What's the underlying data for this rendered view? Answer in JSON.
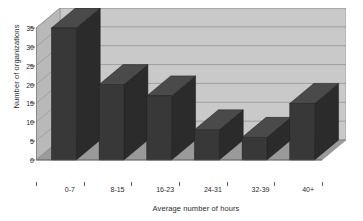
{
  "chart_data": {
    "type": "bar",
    "title": "",
    "xlabel": "Average number of hours",
    "ylabel": "Number of organizations",
    "categories": [
      "0-7",
      "8-15",
      "16-23",
      "24-31",
      "32-39",
      "40+"
    ],
    "values": [
      35,
      20,
      17,
      8,
      6,
      15
    ],
    "ylim": [
      0,
      35
    ],
    "yticks": [
      0,
      5,
      10,
      15,
      20,
      25,
      30,
      35
    ],
    "ytick_labels": [
      "0",
      "5",
      "10",
      "15",
      "20",
      "25",
      "30",
      "35"
    ],
    "grid": true,
    "grid_axis": "y",
    "legend": false,
    "style": "3d-column",
    "colors": {
      "bar_front": "#383838",
      "bar_side": "#2b2b2b",
      "bar_top": "#4a4a4a",
      "plot_back_wall": "#c9c9c9",
      "plot_side_wall": "#b9b9b9",
      "plot_floor": "#9a9a9a",
      "gridline": "#8e8e8e",
      "axis_text": "#2b2b2b",
      "background": "#ffffff"
    }
  },
  "axes": {
    "y_title": "Number of organizations",
    "x_title": "Average number of hours"
  }
}
